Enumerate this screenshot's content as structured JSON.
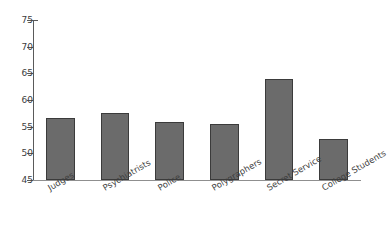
{
  "chart_data": {
    "type": "bar",
    "title": "",
    "xlabel": "",
    "ylabel": "",
    "categories": [
      "Judges",
      "Psychiatrists",
      "Police",
      "Polygraphers",
      "Secret Service",
      "College Students"
    ],
    "values": [
      56.6,
      57.5,
      55.8,
      55.5,
      64.0,
      52.7
    ],
    "ylim": [
      45,
      75
    ],
    "ytick_labels": [
      "45",
      "50",
      "55",
      "60",
      "65",
      "70",
      "75"
    ],
    "ytick_values": [
      45,
      50,
      55,
      60,
      65,
      70,
      75
    ],
    "grid": false,
    "legend": false,
    "bar_color": "#6b6b6b",
    "bar_edge_color": "#3b3b3b",
    "background_color": "#ffffff",
    "axis_color": "#5a5a5a",
    "label_rotation_degrees": -30
  }
}
